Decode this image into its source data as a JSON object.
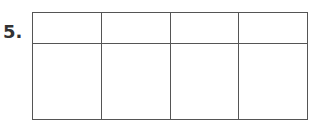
{
  "problem": {
    "number": "5."
  },
  "grid": {
    "columns": 4,
    "rows": [
      {
        "cells": [
          "",
          "",
          "",
          ""
        ]
      },
      {
        "cells": [
          "",
          "",
          "",
          ""
        ]
      }
    ],
    "line_color": "#555555"
  }
}
